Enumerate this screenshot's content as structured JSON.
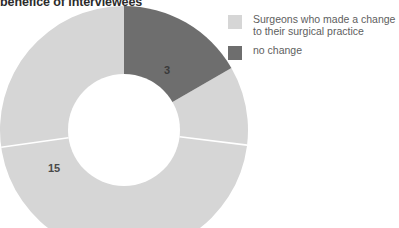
{
  "title": "benefice of interviewees",
  "colors": {
    "light": "#d6d6d6",
    "dark": "#6e6e6e",
    "label": "#3a3a3a",
    "legend_text": "#5e5e5e",
    "title": "#2b2b2b",
    "separator": "#ffffff",
    "background": "#ffffff"
  },
  "legend": {
    "items": [
      {
        "label": "Surgeons who made a change\nto their surgical practice",
        "color": "#d6d6d6",
        "swatch_name": "legend-swatch-change"
      },
      {
        "label": "no change",
        "color": "#6e6e6e",
        "swatch_name": "legend-swatch-no-change"
      }
    ]
  },
  "labels": {
    "dark_slice": "3",
    "light_slice": "15"
  },
  "chart_data": {
    "type": "pie",
    "variant": "donut",
    "title": "benefice of interviewees",
    "categories": [
      "no change",
      "Surgeons who made a change to their surgical practice"
    ],
    "values": [
      3,
      15
    ],
    "total": 18,
    "data_labels": [
      "3",
      "15"
    ],
    "colors": [
      "#6e6e6e",
      "#d6d6d6"
    ],
    "legend_position": "right",
    "grid": false,
    "start_angle_deg": 0,
    "direction": "clockwise",
    "inner_radius_ratio": 0.5
  }
}
